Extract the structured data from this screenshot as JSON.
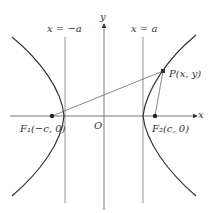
{
  "diagram": {
    "type": "hyperbola-foci",
    "labels": {
      "y_axis": "y",
      "x_axis": "x",
      "origin": "O",
      "left_directrix": "x = −a",
      "right_directrix": "x = a",
      "point": "P(x, y)",
      "focus_left": "F₁(−c, 0)",
      "focus_right": "F₂(c, 0)"
    },
    "colors": {
      "curve": "#333333",
      "lines": "#555555",
      "background": "#ffffff"
    }
  }
}
